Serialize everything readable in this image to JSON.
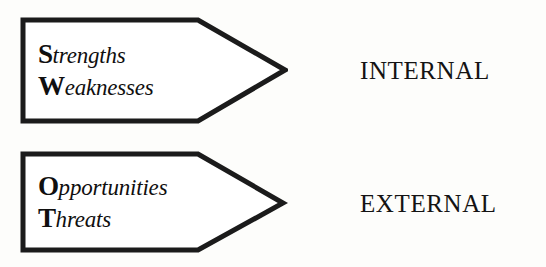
{
  "diagram": {
    "background_color": "#fdfdfb",
    "stroke_color": "#1b1b1b",
    "fill_color": "#ffffff",
    "text_color": "#100f0f",
    "groups": [
      {
        "id": "internal",
        "caption": "INTERNAL",
        "items": [
          {
            "initial": "S",
            "rest": "trengths",
            "full": "Strengths"
          },
          {
            "initial": "W",
            "rest": "eaknesses",
            "full": "Weaknesses"
          }
        ]
      },
      {
        "id": "external",
        "caption": "EXTERNAL",
        "items": [
          {
            "initial": "O",
            "rest": "pportunities",
            "full": "Opportunities"
          },
          {
            "initial": "T",
            "rest": "hreats",
            "full": "Threats"
          }
        ]
      }
    ]
  }
}
